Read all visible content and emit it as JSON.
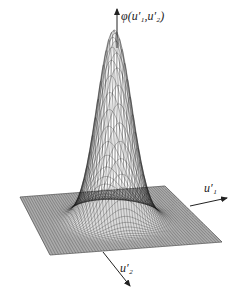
{
  "figure": {
    "type": "3d-surface-plot",
    "axis_labels": {
      "vertical": "φ(u′₁,u′₂)",
      "x": "u′₁",
      "y": "u′₂"
    },
    "colors": {
      "background": "#ffffff",
      "mesh": "#1a1a1a",
      "axis": "#222222"
    }
  }
}
